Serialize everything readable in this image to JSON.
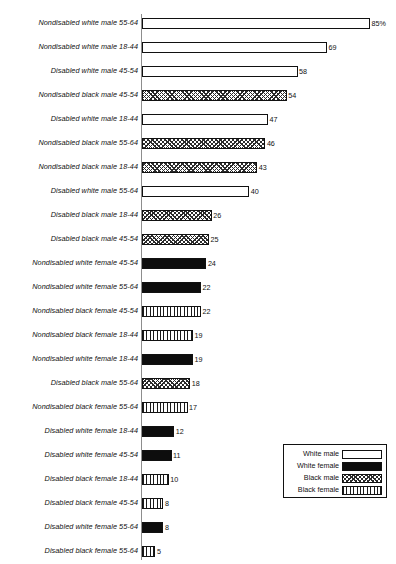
{
  "chart_data": {
    "type": "bar",
    "orientation": "horizontal",
    "title": "",
    "subtitle": "",
    "xlabel": "",
    "ylabel": "",
    "xlim": [
      0,
      85
    ],
    "grid": false,
    "value_suffix_first": "%",
    "legend_position": "bottom-right",
    "series_names": [
      "White male",
      "White female",
      "Black male",
      "Black female"
    ],
    "categories": [
      "Nondisabled white male 55-64",
      "Nondisabled white male 18-44",
      "Disabled white male 45-54",
      "Nondisabled black male 45-54",
      "Disabled white male 18-44",
      "Nondisabled black male 55-64",
      "Nondisabled black male 18-44",
      "Disabled white male 55-64",
      "Disabled black male 18-44",
      "Disabled black male 45-54",
      "Nondisabled white female 45-54",
      "Nondisabled white female 55-64",
      "Nondisabled black female 45-54",
      "Nondisabled black female 18-44",
      "Nondisabled white female 18-44",
      "Disabled black male 55-64",
      "Nondisabled black female 55-64",
      "Disabled white female 18-44",
      "Disabled white female 45-54",
      "Disabled black female 18-44",
      "Disabled black female 45-54",
      "Disabled white female 55-64",
      "Disabled black female 55-64"
    ],
    "values": [
      85,
      69,
      58,
      54,
      47,
      46,
      43,
      40,
      26,
      25,
      24,
      22,
      22,
      19,
      19,
      18,
      17,
      12,
      11,
      10,
      8,
      8,
      5
    ],
    "groups": [
      "white-male",
      "white-male",
      "white-male",
      "black-male",
      "white-male",
      "black-male",
      "black-male",
      "white-male",
      "black-male",
      "black-male",
      "white-female",
      "white-female",
      "black-female",
      "black-female",
      "white-female",
      "black-male",
      "black-female",
      "white-female",
      "white-female",
      "black-female",
      "black-female",
      "white-female",
      "black-female"
    ]
  },
  "rows": [
    {
      "label": "Nondisabled white male 55-64",
      "value": 85,
      "value_text": "85%",
      "group": "white-male"
    },
    {
      "label": "Nondisabled white male 18-44",
      "value": 69,
      "value_text": "69",
      "group": "white-male"
    },
    {
      "label": "Disabled white male 45-54",
      "value": 58,
      "value_text": "58",
      "group": "white-male"
    },
    {
      "label": "Nondisabled black male 45-54",
      "value": 54,
      "value_text": "54",
      "group": "black-male"
    },
    {
      "label": "Disabled white male 18-44",
      "value": 47,
      "value_text": "47",
      "group": "white-male"
    },
    {
      "label": "Nondisabled black male 55-64",
      "value": 46,
      "value_text": "46",
      "group": "black-male"
    },
    {
      "label": "Nondisabled black male 18-44",
      "value": 43,
      "value_text": "43",
      "group": "black-male"
    },
    {
      "label": "Disabled white male 55-64",
      "value": 40,
      "value_text": "40",
      "group": "white-male"
    },
    {
      "label": "Disabled black male 18-44",
      "value": 26,
      "value_text": "26",
      "group": "black-male"
    },
    {
      "label": "Disabled black male 45-54",
      "value": 25,
      "value_text": "25",
      "group": "black-male"
    },
    {
      "label": "Nondisabled white female 45-54",
      "value": 24,
      "value_text": "24",
      "group": "white-female"
    },
    {
      "label": "Nondisabled white female 55-64",
      "value": 22,
      "value_text": "22",
      "group": "white-female"
    },
    {
      "label": "Nondisabled black female 45-54",
      "value": 22,
      "value_text": "22",
      "group": "black-female"
    },
    {
      "label": "Nondisabled black female 18-44",
      "value": 19,
      "value_text": "19",
      "group": "black-female"
    },
    {
      "label": "Nondisabled white female 18-44",
      "value": 19,
      "value_text": "19",
      "group": "white-female"
    },
    {
      "label": "Disabled black male 55-64",
      "value": 18,
      "value_text": "18",
      "group": "black-male"
    },
    {
      "label": "Nondisabled black female 55-64",
      "value": 17,
      "value_text": "17",
      "group": "black-female"
    },
    {
      "label": "Disabled white female 18-44",
      "value": 12,
      "value_text": "12",
      "group": "white-female"
    },
    {
      "label": "Disabled white female 45-54",
      "value": 11,
      "value_text": "11",
      "group": "white-female"
    },
    {
      "label": "Disabled black female 18-44",
      "value": 10,
      "value_text": "10",
      "group": "black-female"
    },
    {
      "label": "Disabled black female 45-54",
      "value": 8,
      "value_text": "8",
      "group": "black-female"
    },
    {
      "label": "Disabled white female 55-64",
      "value": 8,
      "value_text": "8",
      "group": "white-female"
    },
    {
      "label": "Disabled black female 55-64",
      "value": 5,
      "value_text": "5",
      "group": "black-female"
    }
  ],
  "legend": {
    "items": [
      {
        "label": "White male",
        "group": "white-male"
      },
      {
        "label": "White female",
        "group": "white-female"
      },
      {
        "label": "Black male",
        "group": "black-male"
      },
      {
        "label": "Black female",
        "group": "black-female"
      }
    ]
  },
  "colors": {
    "axis": "#8d8d8d",
    "outline": "#111111",
    "solid_fill": "#0d0d0d",
    "background": "#ffffff"
  }
}
